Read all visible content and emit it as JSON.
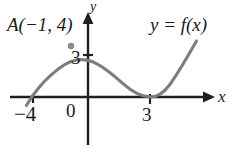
{
  "figure": {
    "kind": "cartesian-graph",
    "background": "#ffffff",
    "curve_color": "#7d7d7d",
    "axis_color": "#1f1f1f",
    "text_color": "#1a1a1a"
  },
  "labels": {
    "point_A": "A(−1, 4)",
    "function": "y = f(x)",
    "y_axis": "y",
    "x_axis": "x",
    "y_intercept_tick": "3",
    "origin": "0",
    "x_root_left": "−4",
    "x_root_right": "3"
  },
  "chart_data": {
    "type": "line",
    "title": "",
    "xlabel": "x",
    "ylabel": "y",
    "legend": [
      "y = f(x)"
    ],
    "legend_position": "top-right",
    "grid": false,
    "xlim": [
      -5.2,
      5.6
    ],
    "ylim": [
      -1.6,
      6.2
    ],
    "xticks": [
      -4,
      0,
      3
    ],
    "xticklabels": [
      "−4",
      "0",
      "3"
    ],
    "yticks": [
      3
    ],
    "yticklabels": [
      "3"
    ],
    "annotations": [
      {
        "text": "A(−1, 4)",
        "x": -1,
        "y": 4,
        "marker": true
      },
      {
        "text": "y = f(x)",
        "x": 3.4,
        "y": 5.5,
        "marker": false
      }
    ],
    "roots": [
      -4,
      3
    ],
    "local_maximum": {
      "x": -1,
      "y": 4
    },
    "local_minimum": {
      "x": 3,
      "y": 0
    },
    "series": [
      {
        "name": "y = f(x)",
        "x": [
          -4.35,
          -4.0,
          -3.6,
          -3.2,
          -2.8,
          -2.4,
          -2.0,
          -1.6,
          -1.2,
          -1.0,
          -0.6,
          -0.2,
          0.2,
          0.6,
          1.0,
          1.4,
          1.8,
          2.2,
          2.6,
          3.0,
          3.3,
          3.6,
          3.9,
          4.2,
          4.45
        ],
        "y": [
          -0.62,
          0.0,
          0.66,
          1.29,
          1.89,
          2.44,
          2.93,
          3.36,
          3.7,
          3.84,
          3.96,
          3.92,
          3.64,
          3.16,
          2.55,
          1.87,
          1.19,
          0.58,
          0.15,
          0.0,
          0.36,
          1.06,
          2.07,
          3.34,
          4.52
        ]
      }
    ]
  },
  "markers": {
    "peak_dot": {
      "x": -1,
      "y": 4,
      "color": "#8a8a8a",
      "radius": 3.2
    }
  }
}
